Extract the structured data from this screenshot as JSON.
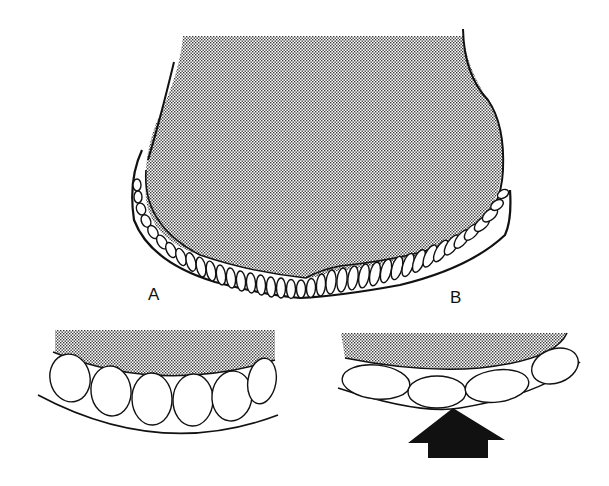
{
  "figure": {
    "labels": {
      "a": "A",
      "b": "B"
    },
    "colors": {
      "ink": "#111111",
      "stipple": "#4a4a4a",
      "background": "#ffffff",
      "cell_fill": "#ffffff"
    },
    "panels": [
      {
        "id": "main",
        "description": "stippled body with single epithelial cell layer along lower margin"
      },
      {
        "id": "A",
        "description": "uncompressed rounded cells beneath stippled matrix"
      },
      {
        "id": "B",
        "description": "flattened cells compressed by upward force arrow"
      }
    ],
    "icons": {
      "force_arrow": "up-arrow"
    }
  }
}
